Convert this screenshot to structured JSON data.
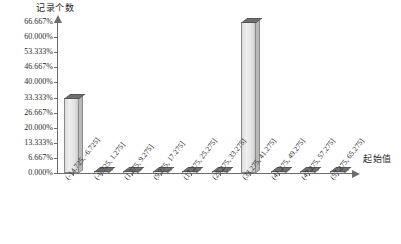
{
  "chart_data": {
    "type": "bar",
    "title": "",
    "ylabel": "记录个数",
    "xlabel": "起始值",
    "categories": [
      "(-14.725, -6.725]",
      "(-6.725, 1.275]",
      "(1.275, 9.275]",
      "(9.275, 17.275]",
      "(17.275, 25.275]",
      "(25.275, 33.275]",
      "(33.275, 41.275]",
      "(41.275, 49.275]",
      "(47.275, 57.275]",
      "(57.275, 65.275]"
    ],
    "values": [
      33.333,
      0.0,
      0.0,
      0.0,
      0.0,
      0.0,
      66.667,
      0.0,
      0.0,
      0.0
    ],
    "value_labels": [
      "33.333%",
      "0.000%",
      "0.000%",
      "0.000%",
      "0.000%",
      "0.000%",
      "66.667%",
      "0.000%",
      "0.000%",
      "0.000%"
    ],
    "ylim": [
      0,
      66.667
    ],
    "ytick_labels": [
      "66.667%",
      "60.000%",
      "53.333%",
      "46.667%",
      "40.000%",
      "33.333%",
      "26.667%",
      "20.000%",
      "13.333%",
      "6.667%",
      "0.000%"
    ],
    "ytick_values": [
      66.667,
      60.0,
      53.333,
      46.667,
      40.0,
      33.333,
      26.667,
      20.0,
      13.333,
      6.667,
      0.0
    ],
    "grid": false,
    "legend": "none",
    "series_color": "#e2e2e2",
    "series_edge_color": "#8a8a8a",
    "series_top_color": "#6f6f6f",
    "axis_color": "#6d6d6d"
  },
  "caption": {
    "text": ""
  }
}
